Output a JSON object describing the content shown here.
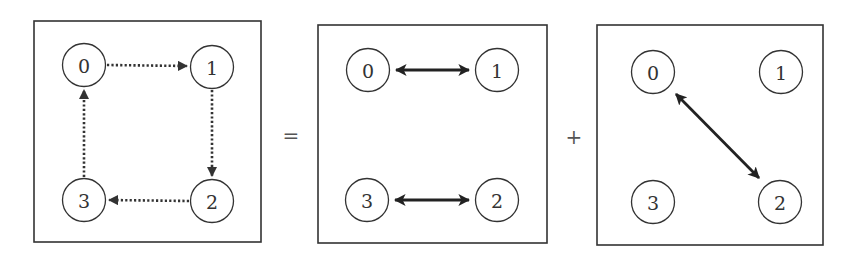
{
  "figure": {
    "operators": {
      "equals": "=",
      "plus": "+"
    },
    "panels": [
      {
        "id": "panel-cycle",
        "nodes": [
          {
            "label": "0",
            "cx": 84,
            "cy": 65
          },
          {
            "label": "1",
            "cx": 212,
            "cy": 67
          },
          {
            "label": "2",
            "cx": 212,
            "cy": 201
          },
          {
            "label": "3",
            "cx": 84,
            "cy": 200
          }
        ],
        "edges": [
          {
            "from": "0",
            "to": "1",
            "style": "dotted",
            "direction": "forward"
          },
          {
            "from": "1",
            "to": "2",
            "style": "dotted",
            "direction": "forward"
          },
          {
            "from": "2",
            "to": "3",
            "style": "dotted",
            "direction": "forward"
          },
          {
            "from": "3",
            "to": "0",
            "style": "dotted",
            "direction": "forward"
          }
        ]
      },
      {
        "id": "panel-horizontal-swaps",
        "nodes": [
          {
            "label": "0",
            "cx": 368,
            "cy": 70
          },
          {
            "label": "1",
            "cx": 497,
            "cy": 70
          },
          {
            "label": "2",
            "cx": 497,
            "cy": 200
          },
          {
            "label": "3",
            "cx": 367,
            "cy": 200
          }
        ],
        "edges": [
          {
            "from": "0",
            "to": "1",
            "style": "solid",
            "direction": "both"
          },
          {
            "from": "3",
            "to": "2",
            "style": "solid",
            "direction": "both"
          }
        ]
      },
      {
        "id": "panel-diagonal-swap",
        "nodes": [
          {
            "label": "0",
            "cx": 653,
            "cy": 72
          },
          {
            "label": "1",
            "cx": 781,
            "cy": 72
          },
          {
            "label": "2",
            "cx": 780,
            "cy": 202
          },
          {
            "label": "3",
            "cx": 653,
            "cy": 202
          }
        ],
        "edges": [
          {
            "from": "0",
            "to": "2",
            "style": "solid",
            "direction": "both"
          }
        ]
      }
    ]
  }
}
